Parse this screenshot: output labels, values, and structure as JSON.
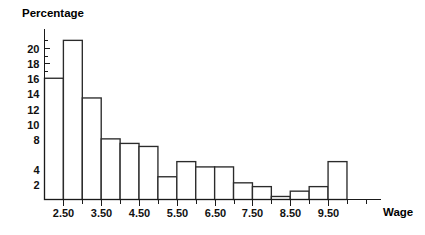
{
  "chart_data": {
    "type": "bar",
    "title": "",
    "ylabel": "Percentage",
    "xlabel": "Wage",
    "ylim": [
      0,
      22.5
    ],
    "xlim": [
      2.0,
      10.9
    ],
    "grid": false,
    "legend": null,
    "bin_width": 0.5,
    "y_ticks": [
      2,
      4,
      6,
      8,
      10,
      12,
      14,
      16,
      18,
      20
    ],
    "y_tick_labels": [
      "2",
      "4",
      "",
      "8",
      "10",
      "12",
      "14",
      "16",
      "18",
      "20"
    ],
    "y_minor_ticks": [
      1,
      3,
      5,
      7,
      9,
      11,
      13,
      15,
      17,
      19,
      21
    ],
    "x_ticks": [
      2.5,
      3.5,
      4.5,
      5.5,
      6.5,
      7.5,
      8.5,
      9.5
    ],
    "x_tick_labels": [
      "2.50",
      "3.50",
      "4.50",
      "5.50",
      "6.50",
      "7.50",
      "8.50",
      "9.50"
    ],
    "x_minor_ticks": [
      3.0,
      4.0,
      5.0,
      6.0,
      7.0,
      8.0,
      9.0,
      10.0,
      10.5
    ],
    "categories": [
      "2.00-2.50",
      "2.50-3.00",
      "3.00-3.50",
      "3.50-4.00",
      "4.00-4.50",
      "4.50-5.00",
      "5.00-5.50",
      "5.50-6.00",
      "6.00-6.50",
      "6.50-7.00",
      "7.00-7.50",
      "7.50-8.00",
      "8.00-8.50",
      "8.50-9.00",
      "9.00-9.50",
      "9.50-10.00"
    ],
    "bin_edges": [
      2.0,
      2.5,
      3.0,
      3.5,
      4.0,
      4.5,
      5.0,
      5.5,
      6.0,
      6.5,
      7.0,
      7.5,
      8.0,
      8.5,
      9.0,
      9.5,
      10.0
    ],
    "values": [
      16.0,
      21.0,
      13.4,
      8.0,
      7.4,
      7.0,
      3.0,
      5.0,
      4.3,
      4.3,
      2.2,
      1.7,
      0.4,
      1.1,
      1.7,
      5.0
    ]
  },
  "labels": {
    "y_axis_title": "Percentage",
    "x_axis_title": "Wage"
  }
}
